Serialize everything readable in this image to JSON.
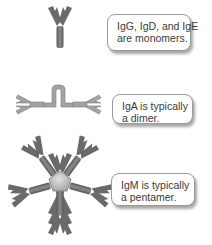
{
  "figure": {
    "colors": {
      "antibody": "#6e6e6e",
      "antibody_light": "#8c8c8c",
      "igA_body": "#a3a3a3",
      "j_chain_core": "#c8c8c8",
      "callout_border": "#9a9a9a",
      "text": "#3a3a3a"
    },
    "items": [
      {
        "id": "monomer",
        "callout_lines": [
          "IgG, IgD, and IgE",
          "are monomers."
        ]
      },
      {
        "id": "dimer",
        "callout_lines": [
          "IgA is typically",
          "a dimer."
        ]
      },
      {
        "id": "pentamer",
        "callout_lines": [
          "IgM is typically",
          "a pentamer."
        ]
      }
    ]
  }
}
